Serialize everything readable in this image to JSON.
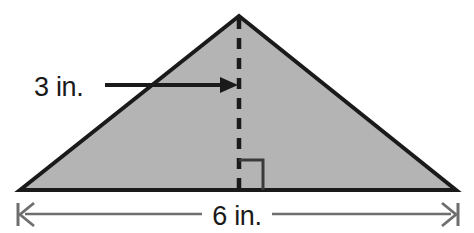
{
  "figure": {
    "type": "geometry-diagram",
    "shape": "triangle",
    "background_color": "#ffffff",
    "fill_color": "#b4b4b4",
    "outline_color": "#1a1a1a",
    "dimension_line_color": "#6e6e6e",
    "text_color": "#1a1a1a"
  },
  "labels": {
    "height_label": "3 in.",
    "base_label": "6 in."
  },
  "measurements": {
    "height_value": 3,
    "base_value": 6,
    "unit": "in."
  },
  "geometry": {
    "apex": [
      239,
      16
    ],
    "left_vertex": [
      20,
      190
    ],
    "right_vertex": [
      456,
      190
    ],
    "height_line": {
      "x": 239,
      "y_top": 18,
      "y_bottom": 190,
      "style": "dashed"
    },
    "right_angle_marker": {
      "x": 239,
      "y": 158,
      "size": 24,
      "side": "right"
    },
    "height_arrow": {
      "x_start": 105,
      "x_end": 238,
      "y": 85,
      "head": "right"
    },
    "base_dimension_line": {
      "x_start": 17,
      "x_end": 459,
      "y": 214,
      "caps": "barbed-tick-both-ends"
    }
  },
  "icon_names": {
    "height_arrow": "arrow-right-icon",
    "right_angle": "right-angle-marker-icon",
    "left_dimension_cap": "dimension-arrow-left-icon",
    "right_dimension_cap": "dimension-arrow-right-icon"
  }
}
